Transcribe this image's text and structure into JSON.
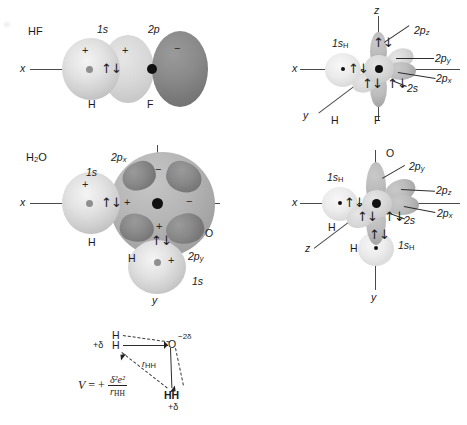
{
  "figure": {
    "type": "chemistry-orbital-overlap-diagram",
    "panels": [
      {
        "id": "hf-sigma",
        "molecule": "HF",
        "axis_labels": [
          "x"
        ],
        "orbital_labels": [
          "1s",
          "2p"
        ],
        "atom_labels": [
          "H",
          "F"
        ],
        "phase_signs": [
          "+",
          "+",
          "−"
        ],
        "electron_pairs": 1
      },
      {
        "id": "hf-3d",
        "axis_labels": [
          "z",
          "x",
          "y"
        ],
        "orbital_labels": [
          "1s_H",
          "2p_z",
          "2p_y",
          "2p_x",
          "2s"
        ],
        "atom_labels": [
          "H",
          "F"
        ],
        "electron_pairs": 4
      },
      {
        "id": "h2o-sigma",
        "molecule": "H2O",
        "axis_labels": [
          "x",
          "y"
        ],
        "orbital_labels": [
          "1s",
          "2p_x",
          "2p_y",
          "1s"
        ],
        "atom_labels": [
          "H",
          "H",
          "O"
        ],
        "phase_signs": [
          "+",
          "+",
          "−",
          "−",
          "+",
          "+"
        ],
        "electron_pairs": 2
      },
      {
        "id": "h2o-3d",
        "axis_labels": [
          "x",
          "y",
          "z"
        ],
        "orbital_labels": [
          "1s_H",
          "1s_H",
          "2p_y",
          "2p_z",
          "2p_x",
          "2s"
        ],
        "atom_labels": [
          "O",
          "H",
          "H"
        ],
        "electron_pairs": 5
      },
      {
        "id": "dipole-potential",
        "atom_labels": [
          "H",
          "H",
          "O",
          "H",
          "H"
        ],
        "charge_labels": [
          "+δ",
          "−2δ",
          "+δ"
        ],
        "distance_label": "r_HH",
        "equation": "V = + δ²e² / r_HH"
      }
    ],
    "text": {
      "hf": "HF",
      "h2o_pre": "H",
      "h2o_sub": "2",
      "h2o_post": "O",
      "one_s": "1s",
      "two_p": "2p",
      "two_s": "2s",
      "two_px": "2p",
      "two_py": "2p",
      "two_pz": "2p",
      "sub_x": "x",
      "sub_y": "y",
      "sub_z": "z",
      "sub_h": "H",
      "atom_h": "H",
      "atom_f": "F",
      "atom_o": "O",
      "axis_x": "x",
      "axis_y": "y",
      "axis_z": "z",
      "plus": "+",
      "minus": "−",
      "spin_pair": "↑↓",
      "v_symbol": "V",
      "equals_plus": "= +",
      "numerator": "δ²e²",
      "denominator_r": "r",
      "denominator_sub": "HH",
      "r_label": "r",
      "r_label_sub": "HH",
      "delta_plus": "+δ",
      "delta_minus2": "−2δ",
      "hh": "HH"
    },
    "colors": {
      "background": "#ffffff",
      "axis": "#4a4a4a",
      "nucleus": "#111111",
      "h_nucleus": "#8f8f8f",
      "orbital_light": "#e2e2e2",
      "orbital_mid": "#bcbcbc",
      "orbital_dark": "#7a7a7a",
      "text": "#1a1a1a"
    }
  }
}
